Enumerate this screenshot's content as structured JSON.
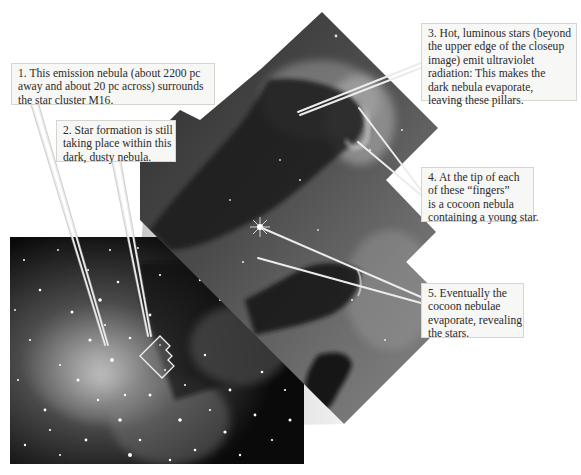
{
  "figure": {
    "overview_panel": {
      "label": "wide-field emission nebula photo"
    },
    "closeup_panel": {
      "label": "pillars closeup (Hubble mosaic)"
    },
    "inset_outline": {
      "label": "outline of closeup region"
    }
  },
  "callouts": [
    {
      "id": "1",
      "lines": [
        "1. This emission nebula (about 2200 pc",
        "away and about 20 pc across) surrounds",
        "the star cluster M16."
      ]
    },
    {
      "id": "2",
      "lines": [
        "2. Star formation is still",
        "taking place within this",
        "dark, dusty nebula."
      ]
    },
    {
      "id": "3",
      "lines": [
        "3. Hot, luminous stars (beyond",
        "the upper edge of the closeup",
        "image) emit ultraviolet",
        "radiation: This makes the",
        "dark nebula evaporate,",
        "leaving these pillars."
      ]
    },
    {
      "id": "4",
      "lines": [
        "4. At the tip of each",
        "of these “fingers”",
        "is a cocoon nebula",
        "containing a young star."
      ]
    },
    {
      "id": "5",
      "lines": [
        "5. Eventually the",
        "cocoon nebulae",
        "evaporate, revealing",
        "the stars."
      ]
    }
  ],
  "colors": {
    "background": "#ffffff",
    "callout_fill": "#f7f7f5",
    "callout_border": "#d6d6d0",
    "leader_line": "#e8e8e4",
    "space_dark": "#0a0a0a",
    "nebula_gray": "#6a6a6a"
  }
}
